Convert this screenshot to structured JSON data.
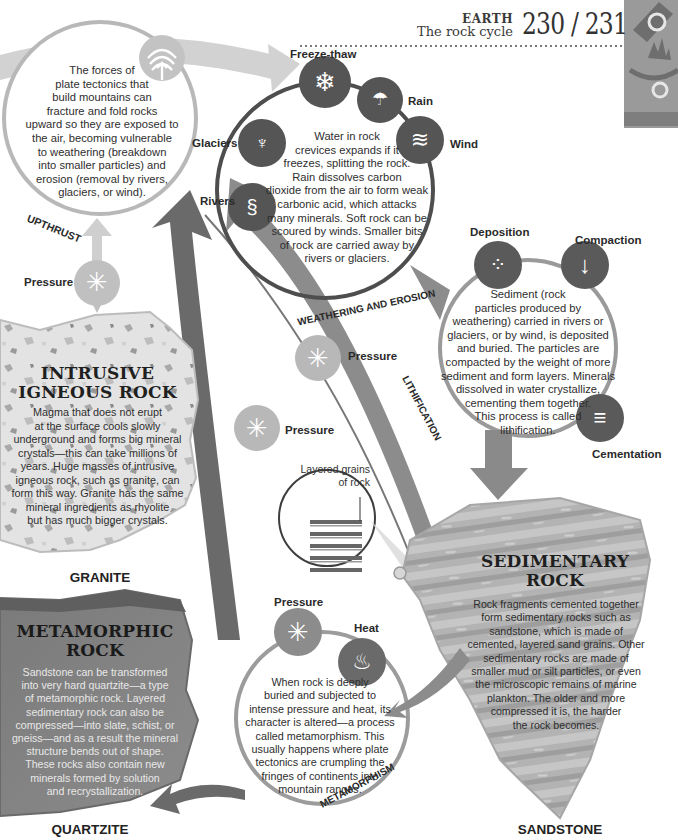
{
  "header": {
    "section": "EARTH",
    "subtitle": "The rock cycle",
    "pages": "230 / 231",
    "corner_icon": "microscope-crystal-icon"
  },
  "upthrust": {
    "label": "UPTHRUST",
    "icon": "upthrust-arrow-icon",
    "text": "The forces of plate tectonics that build mountains can fracture and fold rocks upward so they are exposed to the air, becoming vulnerable to weathering (breakdown into smaller particles) and erosion (removal by rivers, glaciers, or wind).",
    "lines": [
      "The forces of",
      "plate tectonics that",
      "build mountains can",
      "fracture and fold rocks",
      "upward so they are exposed to",
      "the air, becoming vulnerable",
      "to weathering (breakdown",
      "into smaller particles) and",
      "erosion (removal by rivers,",
      "glaciers, or wind)."
    ]
  },
  "weathering": {
    "label": "WEATHERING AND EROSION",
    "agents": [
      {
        "label": "Freeze-thaw",
        "icon": "snowflake-icon"
      },
      {
        "label": "Rain",
        "icon": "rain-cloud-icon"
      },
      {
        "label": "Wind",
        "icon": "wind-icon"
      },
      {
        "label": "Glaciers",
        "icon": "glacier-icon"
      },
      {
        "label": "Rivers",
        "icon": "river-icon"
      }
    ],
    "lines": [
      "Water in rock",
      "crevices expands if it",
      "freezes, splitting the rock.",
      "Rain dissolves carbon",
      "dioxide from the air to form weak",
      "carbonic acid, which attacks",
      "many minerals. Soft rock can be",
      "scoured by winds. Smaller bits",
      "of rock are carried away by",
      "rivers or glaciers."
    ]
  },
  "lithification": {
    "label": "LITHIFICATION",
    "stages": [
      {
        "label": "Deposition",
        "icon": "particles-icon"
      },
      {
        "label": "Compaction",
        "icon": "down-arrow-icon"
      },
      {
        "label": "Cementation",
        "icon": "layers-icon"
      }
    ],
    "lines": [
      "Sediment  (rock",
      "particles produced by",
      "weathering) carried in rivers or",
      "glaciers, or by wind, is deposited",
      "and buried. The particles are",
      "compacted by the weight of more",
      "sediment and form layers. Minerals",
      "dissolved in water crystallize,",
      "cementing them together.",
      "This process is called",
      "lithification."
    ]
  },
  "pressure_labels": {
    "upthrust": "Pressure",
    "sed_to_up": "Pressure",
    "meta_to_up": "Pressure"
  },
  "inset": {
    "label_line1": "Layered grains",
    "label_line2": "of rock"
  },
  "igneous": {
    "title_line1": "INTRUSIVE",
    "title_line2": "IGNEOUS ROCK",
    "lines": [
      "Magma that does not erupt",
      "at the surface cools slowly",
      "underground and forms big mineral",
      "crystals—this can take millions of",
      "years. Huge masses of intrusive",
      "igneous rock, such as granite, can",
      "form this way. Granite has the same",
      "mineral ingredients as rhyolite",
      "but has much bigger crystals."
    ],
    "specimen": "GRANITE"
  },
  "sedimentary": {
    "title_line1": "SEDIMENTARY",
    "title_line2": "ROCK",
    "lines": [
      "Rock fragments cemented together",
      "form sedimentary rocks such as",
      "sandstone, which is made of",
      "cemented, layered sand grains. Other",
      "sedimentary rocks are made of",
      "smaller mud or silt particles, or even",
      "the microscopic remains of marine",
      "plankton. The older and more",
      "compressed it is, the harder",
      "the rock becomes."
    ],
    "specimen": "SANDSTONE"
  },
  "metamorphism": {
    "label": "METAMORPHISM",
    "agents": [
      {
        "label": "Pressure",
        "icon": "pressure-icon"
      },
      {
        "label": "Heat",
        "icon": "flame-icon"
      }
    ],
    "lines": [
      "When rock is deeply",
      "buried and subjected to",
      "intense pressure and heat, its",
      "character is altered—a process",
      "called metamorphism. This",
      "usually happens where plate",
      "tectonics are crumpling the",
      "fringes of continents into",
      "mountain ranges."
    ]
  },
  "metamorphic": {
    "title_line1": "METAMORPHIC",
    "title_line2": "ROCK",
    "lines": [
      "Sandstone can be transformed",
      "into very hard quartzite—a type",
      "of metamorphic rock. Layered",
      "sedimentary rock can also be",
      "compressed—into slate, schist, or",
      "gneiss—and as a result the mineral",
      "structure bends out of shape.",
      "These rocks also contain new",
      "minerals formed by solution",
      "and recrystallization."
    ],
    "specimen": "QUARTZITE"
  },
  "colors": {
    "dark_circle": "#5a5a5a",
    "mid_arrow": "#8a8a8a",
    "light_arrow": "#bdbdbd",
    "pressure_circle": "#b5b5b5",
    "text": "#2b2b2b"
  }
}
